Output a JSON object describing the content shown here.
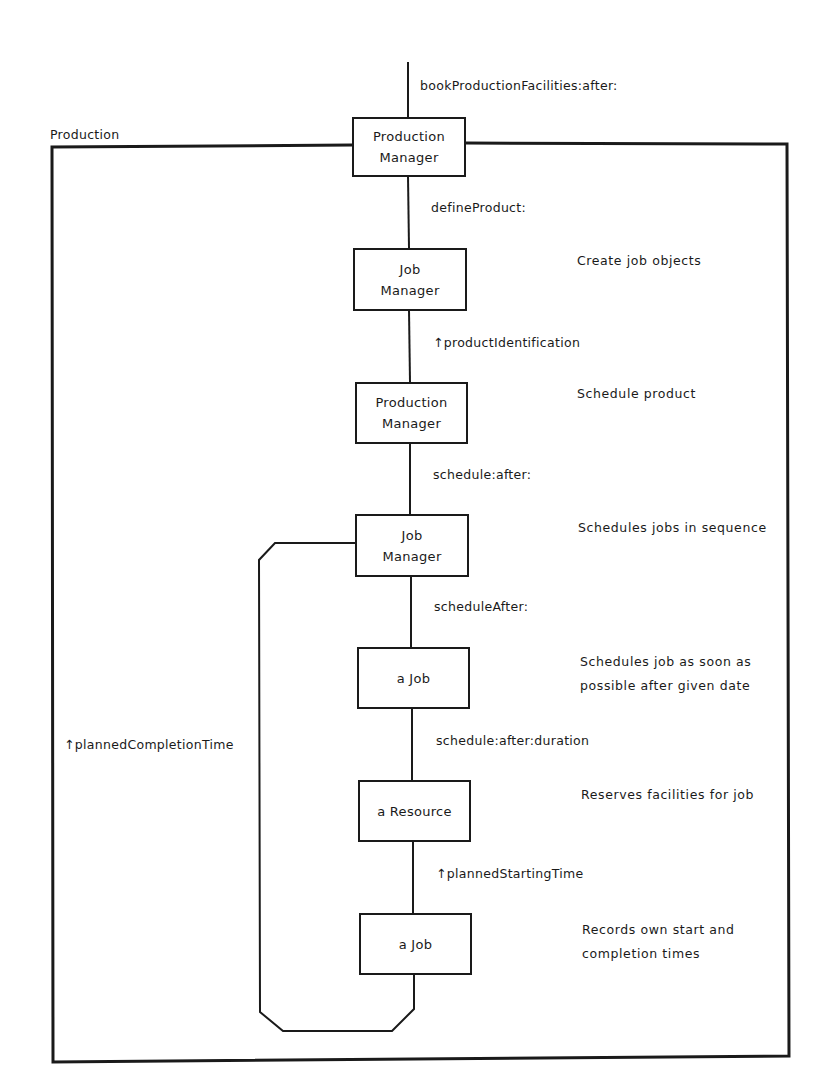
{
  "frame": {
    "title": "Production"
  },
  "entry_message": "bookProductionFacilities:after:",
  "nodes": [
    {
      "line1": "Production",
      "line2": "Manager"
    },
    {
      "line1": "Job",
      "line2": "Manager"
    },
    {
      "line1": "Production",
      "line2": "Manager"
    },
    {
      "line1": "Job",
      "line2": "Manager"
    },
    {
      "line1": "a Job",
      "line2": ""
    },
    {
      "line1": "a Resource",
      "line2": ""
    },
    {
      "line1": "a Job",
      "line2": ""
    }
  ],
  "messages": [
    "defineProduct:",
    "↑productIdentification",
    "schedule:after:",
    "scheduleAfter:",
    "schedule:after:duration",
    "↑plannedStartingTime"
  ],
  "loop_return_message": "↑plannedCompletionTime",
  "descriptions": [
    {
      "line1": "Create job objects",
      "line2": ""
    },
    {
      "line1": "Schedule product",
      "line2": ""
    },
    {
      "line1": "Schedules jobs in sequence",
      "line2": ""
    },
    {
      "line1": "Schedules job as soon as",
      "line2": "possible after given date"
    },
    {
      "line1": "Reserves facilities for job",
      "line2": ""
    },
    {
      "line1": "Records own start and",
      "line2": "completion times"
    }
  ],
  "colors": {
    "line": "#1a1a1a",
    "background": "#ffffff"
  }
}
